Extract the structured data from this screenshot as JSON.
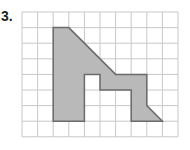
{
  "problem": {
    "number_label": "3."
  },
  "grid": {
    "columns": 10,
    "rows": 8,
    "origin_px": [
      22,
      12
    ],
    "cell_px": 15.6,
    "line_color": "#c8c8c8",
    "background": "#ffffff"
  },
  "shape": {
    "fill": "#b9b9b9",
    "stroke": "#6b6b6b",
    "vertices_grid_units": [
      [
        2,
        1
      ],
      [
        3,
        1
      ],
      [
        6,
        4
      ],
      [
        8,
        4
      ],
      [
        8,
        6
      ],
      [
        9,
        7
      ],
      [
        7,
        7
      ],
      [
        7,
        5
      ],
      [
        5,
        5
      ],
      [
        5,
        4
      ],
      [
        4,
        4
      ],
      [
        4,
        7
      ],
      [
        2,
        7
      ]
    ]
  }
}
